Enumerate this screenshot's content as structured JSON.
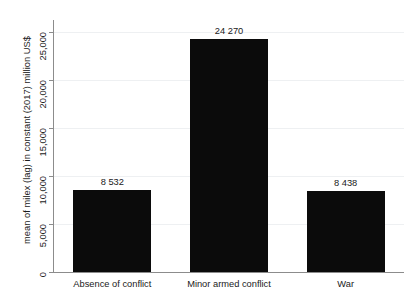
{
  "chart_data": {
    "type": "bar",
    "title": "",
    "xlabel": "",
    "ylabel": "mean of milex (lag) in constant (2017) million US$",
    "categories": [
      "Absence of conflict",
      "Minor armed conflict",
      "War"
    ],
    "values": [
      8532,
      24270,
      8438
    ],
    "value_labels": [
      "8 532",
      "24 270",
      "8 438"
    ],
    "ylim": [
      0,
      26000
    ],
    "yticks": [
      0,
      5000,
      10000,
      15000,
      20000,
      25000
    ],
    "ytick_labels": [
      "0",
      "5,000",
      "10,000",
      "15,000",
      "20,000",
      "25,000"
    ],
    "grid": true,
    "legend": false,
    "bar_color": "#0b0b0b",
    "grid_color": "#eef0f2",
    "axis_color": "#8c8c8c",
    "background": "#ffffff"
  }
}
